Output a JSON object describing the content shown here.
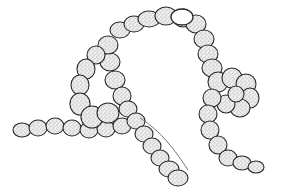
{
  "image": {
    "subject": "stippled ink drawing of a filamentous cyanobacterium chain",
    "background": "#ffffff",
    "ink_color": "#2a2a2a",
    "stipple_fill": "#d9d9d9"
  },
  "filaments": [
    {
      "name": "left-tail",
      "cells": [
        [
          22,
          130,
          9,
          7
        ],
        [
          38,
          128,
          9,
          8
        ],
        [
          55,
          126,
          9,
          8
        ],
        [
          72,
          128,
          9,
          8
        ],
        [
          89,
          130,
          9,
          8
        ],
        [
          106,
          129,
          9,
          8
        ],
        [
          122,
          126,
          9,
          8
        ]
      ]
    },
    {
      "name": "left-loop",
      "cells": [
        [
          115,
          80,
          10,
          9
        ],
        [
          110,
          62,
          10,
          9
        ],
        [
          108,
          45,
          10,
          9
        ],
        [
          96,
          55,
          9,
          9
        ],
        [
          86,
          69,
          9,
          10
        ],
        [
          80,
          85,
          9,
          10
        ],
        [
          80,
          104,
          10,
          11
        ],
        [
          92,
          117,
          11,
          11
        ],
        [
          108,
          113,
          11,
          10
        ]
      ]
    },
    {
      "name": "top-arch",
      "cells": [
        [
          120,
          30,
          10,
          8
        ],
        [
          134,
          24,
          10,
          8
        ],
        [
          149,
          19,
          11,
          8
        ],
        [
          166,
          16,
          11,
          9
        ],
        [
          183,
          18,
          10,
          9
        ],
        [
          196,
          24,
          10,
          9
        ],
        [
          204,
          39,
          10,
          9
        ],
        [
          208,
          54,
          10,
          9
        ],
        [
          212,
          68,
          10,
          9
        ]
      ]
    },
    {
      "name": "center-descending",
      "cells": [
        [
          122,
          96,
          9,
          9
        ],
        [
          128,
          109,
          9,
          8
        ],
        [
          136,
          121,
          9,
          8
        ],
        [
          144,
          134,
          9,
          8
        ],
        [
          152,
          146,
          9,
          8
        ],
        [
          160,
          158,
          9,
          8
        ],
        [
          169,
          169,
          10,
          8
        ],
        [
          178,
          178,
          10,
          8
        ]
      ]
    },
    {
      "name": "right-coil",
      "cells": [
        [
          218,
          82,
          10,
          10
        ],
        [
          232,
          78,
          10,
          10
        ],
        [
          246,
          84,
          10,
          10
        ],
        [
          250,
          98,
          9,
          10
        ],
        [
          240,
          108,
          10,
          9
        ],
        [
          226,
          104,
          9,
          9
        ],
        [
          236,
          94,
          8,
          8
        ],
        [
          212,
          98,
          9,
          9
        ],
        [
          208,
          114,
          9,
          9
        ],
        [
          210,
          130,
          9,
          9
        ],
        [
          218,
          145,
          9,
          9
        ],
        [
          228,
          158,
          9,
          8
        ],
        [
          242,
          163,
          9,
          7
        ],
        [
          256,
          167,
          8,
          6
        ]
      ]
    }
  ],
  "heterocyst": {
    "cx": 182,
    "cy": 17,
    "rx": 11,
    "ry": 8
  }
}
